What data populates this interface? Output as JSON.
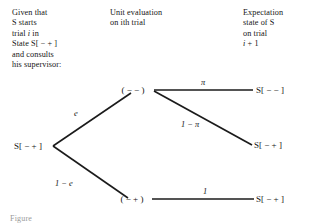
{
  "figure": {
    "type": "probability-tree-diagram",
    "background": "#ffffff",
    "ink_color": "#1b1b1b"
  },
  "headers": {
    "left": "Given that\nS starts\ntrial i in\nState S[ − + ]\nand consults\nhis supervisor:",
    "middle": "Unit evaluation\non ith trial",
    "right": "Expectation\nstate of S\non trial\ni + 1"
  },
  "root": {
    "label": "S[ − + ]"
  },
  "nodes": [
    {
      "id": "upper",
      "label": "( − − )"
    },
    {
      "id": "lower",
      "label": "( − + )"
    }
  ],
  "terminals": [
    {
      "id": "t1",
      "label": "S[ − − ]"
    },
    {
      "id": "t2",
      "label": "S[ − + ]"
    },
    {
      "id": "t3",
      "label": "S[ − + ]"
    }
  ],
  "edges": [
    {
      "id": "e-root-upper",
      "from": "root",
      "to": "upper",
      "label": "e"
    },
    {
      "id": "e-root-lower",
      "from": "root",
      "to": "lower",
      "label": "1 − e"
    },
    {
      "id": "e-upper-t1",
      "from": "upper",
      "to": "t1",
      "label": "π"
    },
    {
      "id": "e-upper-t2",
      "from": "upper",
      "to": "t2",
      "label": "1 − π"
    },
    {
      "id": "e-lower-t3",
      "from": "lower",
      "to": "t3",
      "label": "1"
    }
  ],
  "caption": "Figure"
}
